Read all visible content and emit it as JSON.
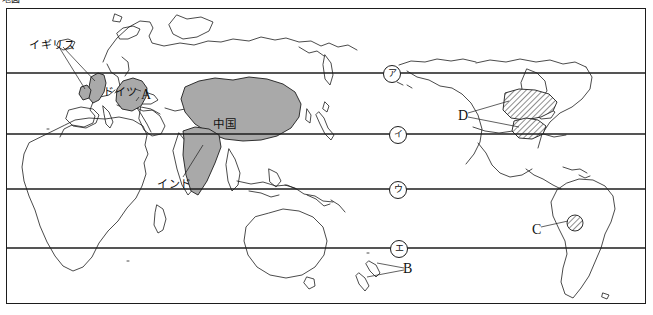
{
  "figure": {
    "crop_fragment_text": "地図",
    "type": "world-map",
    "projection_note": "world map with 4 horizontal latitude lines",
    "frame_color": "#1d1d1d",
    "shaded_country_fill": "#a9a9a9",
    "hatch_fill": "#ffffff",
    "background": "#ffffff"
  },
  "country_labels": [
    {
      "id": "uk",
      "text": "イギリス",
      "x": 28,
      "y": 33
    },
    {
      "id": "germany",
      "text": "ドイツ",
      "x": 102,
      "y": 80
    },
    {
      "id": "china",
      "text": "中国",
      "x": 217,
      "y": 113
    },
    {
      "id": "india",
      "text": "インド",
      "x": 157,
      "y": 172
    }
  ],
  "letter_markers": [
    {
      "id": "A",
      "text": "A",
      "x": 140,
      "y": 85,
      "points_to": "Germany"
    },
    {
      "id": "B",
      "text": "B",
      "x": 401,
      "y": 261,
      "points_to": "New Zealand"
    },
    {
      "id": "C",
      "text": "C",
      "x": 531,
      "y": 223,
      "points_to": "hatched region in northern South America"
    },
    {
      "id": "D",
      "text": "D",
      "x": 457,
      "y": 108,
      "points_to": "two hatched regions in North America"
    }
  ],
  "latitude_markers": [
    {
      "id": "ma",
      "text": "ア",
      "x": 382,
      "y": 64,
      "line": 1
    },
    {
      "id": "mi",
      "text": "イ",
      "x": 388,
      "y": 126,
      "line": 2
    },
    {
      "id": "mu",
      "text": "ウ",
      "x": 388,
      "y": 181,
      "line": 3
    },
    {
      "id": "me",
      "text": "エ",
      "x": 389,
      "y": 238,
      "line": 4
    }
  ],
  "latitude_lines": [
    {
      "id": "line-1",
      "y": 72
    },
    {
      "id": "line-2",
      "y": 133
    },
    {
      "id": "line-3",
      "y": 188
    },
    {
      "id": "line-4",
      "y": 247
    }
  ]
}
